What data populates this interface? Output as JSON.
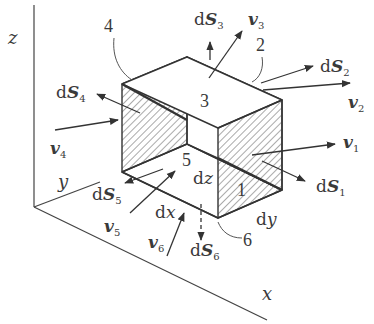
{
  "figure": {
    "type": "diagram",
    "colors": {
      "line": "#3a3a3a",
      "hatch": "#555555",
      "background": "#ffffff"
    }
  },
  "axes": {
    "x": "x",
    "y": "y",
    "z": "z"
  },
  "edges": {
    "dx": "dx",
    "dy": "dy",
    "dz": "dz"
  },
  "faces": [
    {
      "id": "1",
      "label": "1",
      "normal": "dS",
      "normal_sub": "1",
      "velocity": "v",
      "velocity_sub": "1"
    },
    {
      "id": "2",
      "label": "2",
      "normal": "dS",
      "normal_sub": "2",
      "velocity": "v",
      "velocity_sub": "2"
    },
    {
      "id": "3",
      "label": "3",
      "normal": "dS",
      "normal_sub": "3",
      "velocity": "v",
      "velocity_sub": "3"
    },
    {
      "id": "4",
      "label": "4",
      "normal": "dS",
      "normal_sub": "4",
      "velocity": "v",
      "velocity_sub": "4"
    },
    {
      "id": "5",
      "label": "5",
      "normal": "dS",
      "normal_sub": "5",
      "velocity": "v",
      "velocity_sub": "5"
    },
    {
      "id": "6",
      "label": "6",
      "normal": "dS",
      "normal_sub": "6",
      "velocity": "v",
      "velocity_sub": "6"
    }
  ],
  "text": {
    "d": "d",
    "S": "S",
    "v": "v"
  }
}
